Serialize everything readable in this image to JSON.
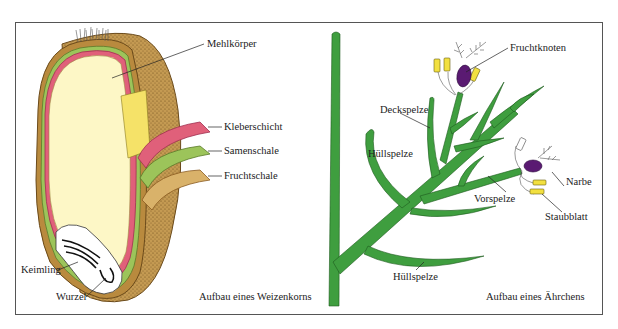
{
  "page": {
    "top_caption": "",
    "colors": {
      "frame": "#555555",
      "husk_brown": "#b98a3e",
      "husk_dark": "#8a5a20",
      "endosperm": "#fdf7c6",
      "aleurone_pink": "#e0607a",
      "seed_coat_green": "#9cc45a",
      "fruit_coat_tan": "#d9b26a",
      "kernel_yellow": "#f5e268",
      "spikelet_green": "#3f9e3f",
      "ovary_purple": "#5a1a72",
      "anther_yellow": "#f2e040"
    }
  },
  "left_panel": {
    "title": "Aufbau eines Weizenkorns",
    "labels": {
      "endosperm": "Mehlkörper",
      "aleurone": "Kleberschicht",
      "seed_coat": "Samenschale",
      "fruit_coat": "Fruchtschale",
      "embryo": "Keimling",
      "root": "Wurzel"
    }
  },
  "right_panel": {
    "title": "Aufbau eines Ährchens",
    "labels": {
      "ovary": "Fruchtknoten",
      "lemma": "Deckspelze",
      "glume_upper": "Hüllspelze",
      "palea": "Vorspelze",
      "stigma": "Narbe",
      "stamen": "Staubblatt",
      "glume_lower": "Hüllspelze"
    }
  }
}
